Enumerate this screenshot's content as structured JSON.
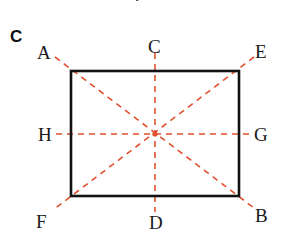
{
  "figure": {
    "title_fragment": "T",
    "background_color": "#ffffff",
    "width": 282,
    "height": 237,
    "corner_annotation": "C",
    "shape": {
      "type": "rectangle",
      "stroke_color": "#121212",
      "stroke_width": 2.5,
      "left": 71,
      "top": 71,
      "right": 239,
      "bottom": 196,
      "width": 168,
      "height": 125
    },
    "center_point": {
      "label": "",
      "x": 155,
      "y": 134,
      "color": "#e0502f"
    },
    "dashed_color": "#e0502f",
    "dash_pattern": "6 5",
    "dash_width": 1.6,
    "labels": [
      {
        "id": "A",
        "text": "A",
        "x": 37,
        "y": 43,
        "role": "upper-left-extension"
      },
      {
        "id": "C",
        "text": "C",
        "x": 148,
        "y": 37,
        "role": "top-center-extension"
      },
      {
        "id": "E",
        "text": "E",
        "x": 255,
        "y": 42,
        "role": "upper-right-extension"
      },
      {
        "id": "H",
        "text": "H",
        "x": 38,
        "y": 125,
        "role": "left-middle-extension"
      },
      {
        "id": "G",
        "text": "G",
        "x": 254,
        "y": 125,
        "role": "right-middle-extension"
      },
      {
        "id": "F",
        "text": "F",
        "x": 36,
        "y": 212,
        "role": "lower-left-extension"
      },
      {
        "id": "D",
        "text": "D",
        "x": 149,
        "y": 213,
        "role": "bottom-center-extension"
      },
      {
        "id": "B",
        "text": "B",
        "x": 255,
        "y": 206,
        "role": "lower-right-extension"
      }
    ],
    "dashed_lines": [
      {
        "id": "A-B",
        "name": "diagonal-a-to-b",
        "x1": 55,
        "y1": 57,
        "x2": 254,
        "y2": 208
      },
      {
        "id": "E-F",
        "name": "diagonal-e-to-f",
        "x1": 254,
        "y1": 57,
        "x2": 53,
        "y2": 210
      },
      {
        "id": "C-D",
        "name": "vertical-c-to-d",
        "x1": 155,
        "y1": 53,
        "x2": 155,
        "y2": 212
      },
      {
        "id": "H-G",
        "name": "horizontal-h-to-g",
        "x1": 56,
        "y1": 134,
        "x2": 252,
        "y2": 134
      }
    ]
  }
}
